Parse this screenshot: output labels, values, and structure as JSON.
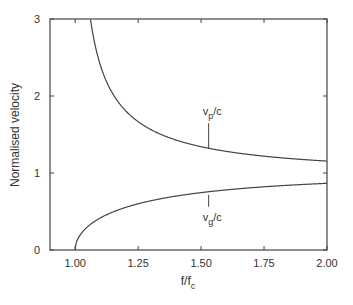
{
  "chart_data": {
    "type": "line",
    "title": "",
    "xlabel": "f/f_c",
    "xlabel_main": "f/f",
    "xlabel_sub": "c",
    "ylabel": "Normalised velocity",
    "xlim": [
      0.9,
      2.0
    ],
    "ylim": [
      0,
      3
    ],
    "xticks": [
      1.0,
      1.25,
      1.5,
      1.75,
      2.0
    ],
    "xtick_labels": [
      "1.00",
      "1.25",
      "1.50",
      "1.75",
      "2.00"
    ],
    "yticks": [
      0,
      1,
      2,
      3
    ],
    "ytick_labels": [
      "0",
      "1",
      "2",
      "3"
    ],
    "grid": false,
    "legend": null,
    "series": [
      {
        "name": "v_p/c",
        "label_main": "v",
        "label_sub": "p",
        "label_tail": "/c",
        "formula": "1/sqrt(1-(fc/f)^2)",
        "x": [
          1.061,
          1.1,
          1.15,
          1.2,
          1.25,
          1.3,
          1.4,
          1.5,
          1.6,
          1.7,
          1.8,
          1.9,
          2.0
        ],
        "values": [
          3.0,
          2.4,
          2.02,
          1.81,
          1.67,
          1.56,
          1.43,
          1.34,
          1.28,
          1.24,
          1.2,
          1.18,
          1.15
        ],
        "annotation_x": 1.53
      },
      {
        "name": "v_g/c",
        "label_main": "v",
        "label_sub": "g",
        "label_tail": "/c",
        "formula": "sqrt(1-(fc/f)^2)",
        "x": [
          1.0,
          1.02,
          1.05,
          1.1,
          1.2,
          1.3,
          1.4,
          1.5,
          1.6,
          1.7,
          1.8,
          1.9,
          2.0
        ],
        "values": [
          0.0,
          0.2,
          0.3,
          0.42,
          0.55,
          0.64,
          0.7,
          0.75,
          0.78,
          0.81,
          0.83,
          0.85,
          0.87
        ],
        "annotation_x": 1.53
      }
    ]
  }
}
